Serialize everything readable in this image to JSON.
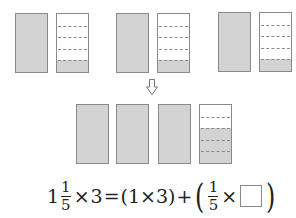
{
  "diagram": {
    "top_row": [
      {
        "whole": {
          "x": 15,
          "y": 13,
          "w": 33,
          "h": 60
        },
        "part": {
          "x": 56,
          "y": 13,
          "w": 33,
          "h": 60,
          "segments": 5,
          "shaded": 1
        }
      },
      {
        "whole": {
          "x": 116,
          "y": 13,
          "w": 33,
          "h": 60
        },
        "part": {
          "x": 157,
          "y": 13,
          "w": 33,
          "h": 60,
          "segments": 5,
          "shaded": 1
        }
      },
      {
        "whole": {
          "x": 218,
          "y": 12,
          "w": 33,
          "h": 60
        },
        "part": {
          "x": 259,
          "y": 12,
          "w": 33,
          "h": 60,
          "segments": 5,
          "shaded": 1
        }
      }
    ],
    "arrow": "down-arrow-icon",
    "bottom_row": [
      {
        "x": 76,
        "y": 104,
        "w": 33,
        "h": 60,
        "segments": 5,
        "shaded": 5
      },
      {
        "x": 116,
        "y": 104,
        "w": 33,
        "h": 60,
        "segments": 5,
        "shaded": 5
      },
      {
        "x": 158,
        "y": 104,
        "w": 33,
        "h": 60,
        "segments": 5,
        "shaded": 5
      },
      {
        "x": 199,
        "y": 104,
        "w": 33,
        "h": 60,
        "segments": 5,
        "shaded": 3
      }
    ],
    "colors": {
      "shade": "#d3d3d3",
      "border": "#8a8a8a"
    }
  },
  "equation": {
    "whole": "1",
    "frac_num": "1",
    "frac_den": "5",
    "times": "×",
    "three": "3",
    "equals": "=",
    "group1": "(1×3)",
    "plus": "+",
    "open_paren": "(",
    "frac2_num": "1",
    "frac2_den": "5",
    "times2": "×",
    "blank": "",
    "close_paren": ")"
  }
}
